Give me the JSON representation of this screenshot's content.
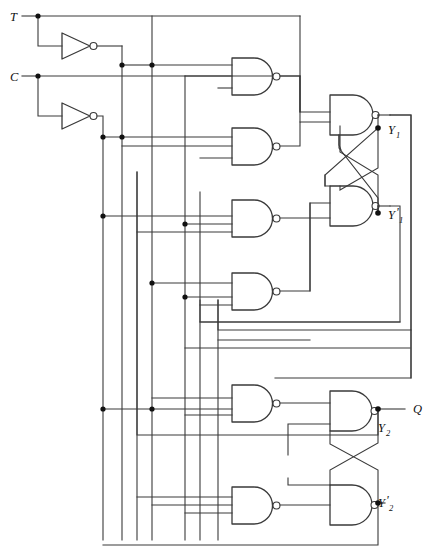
{
  "diagram": {
    "type": "logic-circuit-schematic",
    "width": 433,
    "height": 560,
    "background_color": "#ffffff",
    "wire_color": "#3a3a3a",
    "junction_color": "#111111"
  },
  "inputs": [
    {
      "id": "T",
      "label": "T",
      "x": 12,
      "y": 16
    },
    {
      "id": "C",
      "label": "C",
      "x": 12,
      "y": 76
    }
  ],
  "outputs": [
    {
      "id": "Q",
      "label": "Q",
      "x": 413,
      "y": 409
    }
  ],
  "state_labels": [
    {
      "id": "Y1",
      "base": "Y",
      "sub": "1",
      "prime": "",
      "text": "Y1",
      "x": 391,
      "y": 128
    },
    {
      "id": "Y1p",
      "base": "Y",
      "sub": "1",
      "prime": "'",
      "text": "Y'1",
      "x": 391,
      "y": 213
    },
    {
      "id": "Y2",
      "base": "Y",
      "sub": "2",
      "prime": "",
      "text": "Y2",
      "x": 381,
      "y": 428
    },
    {
      "id": "Y2p",
      "base": "Y",
      "sub": "2",
      "prime": "'",
      "text": "Y'2",
      "x": 381,
      "y": 503
    }
  ],
  "gates": [
    {
      "id": "INV1",
      "type": "inverter",
      "name": "inverter-t",
      "inputs": 1,
      "x": 62,
      "y": 33,
      "w": 30,
      "h": 26
    },
    {
      "id": "INV2",
      "type": "inverter",
      "name": "inverter-c",
      "inputs": 1,
      "x": 62,
      "y": 103,
      "w": 30,
      "h": 26
    },
    {
      "id": "N1",
      "type": "nand",
      "name": "nand-gate-1",
      "inputs": 3,
      "x": 232,
      "y": 58,
      "w": 43,
      "h": 37
    },
    {
      "id": "N2",
      "type": "nand",
      "name": "nand-gate-2",
      "inputs": 3,
      "x": 232,
      "y": 128,
      "w": 43,
      "h": 37
    },
    {
      "id": "N3",
      "type": "nand",
      "name": "nand-gate-3",
      "inputs": 3,
      "x": 232,
      "y": 200,
      "w": 43,
      "h": 37
    },
    {
      "id": "N4",
      "type": "nand",
      "name": "nand-gate-4",
      "inputs": 3,
      "x": 232,
      "y": 273,
      "w": 43,
      "h": 37
    },
    {
      "id": "N5",
      "type": "nand",
      "name": "nand-gate-5",
      "inputs": 3,
      "x": 330,
      "y": 95,
      "w": 45,
      "h": 40
    },
    {
      "id": "N6",
      "type": "nand",
      "name": "nand-gate-6",
      "inputs": 3,
      "x": 330,
      "y": 186,
      "w": 45,
      "h": 40
    },
    {
      "id": "N7",
      "type": "nand",
      "name": "nand-gate-7",
      "inputs": 3,
      "x": 232,
      "y": 385,
      "w": 43,
      "h": 37
    },
    {
      "id": "N8",
      "type": "nand",
      "name": "nand-gate-8",
      "inputs": 3,
      "x": 232,
      "y": 487,
      "w": 43,
      "h": 37
    },
    {
      "id": "N9",
      "type": "nand",
      "name": "nand-gate-9",
      "inputs": 3,
      "x": 330,
      "y": 391,
      "w": 45,
      "h": 40
    },
    {
      "id": "N10",
      "type": "nand",
      "name": "nand-gate-10",
      "inputs": 3,
      "x": 330,
      "y": 485,
      "w": 45,
      "h": 40
    }
  ],
  "junction_dots": [
    {
      "x": 38,
      "y": 16
    },
    {
      "x": 38,
      "y": 76
    },
    {
      "x": 152,
      "y": 65
    },
    {
      "x": 122,
      "y": 65
    },
    {
      "x": 122,
      "y": 137
    },
    {
      "x": 103,
      "y": 137
    },
    {
      "x": 103,
      "y": 216
    },
    {
      "x": 185,
      "y": 224
    },
    {
      "x": 152,
      "y": 283
    },
    {
      "x": 185,
      "y": 297
    },
    {
      "x": 103,
      "y": 409
    },
    {
      "x": 152,
      "y": 409
    },
    {
      "x": 378,
      "y": 128
    },
    {
      "x": 378,
      "y": 213
    },
    {
      "x": 378,
      "y": 409
    },
    {
      "x": 378,
      "y": 503
    }
  ],
  "buses": [
    {
      "id": "bus-t",
      "x": 152,
      "label": "T"
    },
    {
      "id": "bus-tbar",
      "x": 122,
      "label": "T'"
    },
    {
      "id": "bus-c",
      "x": 185,
      "label": "C"
    },
    {
      "id": "bus-cbar",
      "x": 103,
      "label": "C'"
    },
    {
      "id": "bus-fb-a",
      "x": 137,
      "label": "feedback-a"
    },
    {
      "id": "bus-fb-b",
      "x": 200,
      "label": "feedback-b"
    },
    {
      "id": "bus-fb-c",
      "x": 218,
      "label": "feedback-c"
    }
  ],
  "latches": [
    {
      "id": "master",
      "name": "master-latch",
      "gates": [
        "N5",
        "N6"
      ],
      "outputs": [
        "Y1",
        "Y1p"
      ]
    },
    {
      "id": "slave",
      "name": "slave-latch",
      "gates": [
        "N9",
        "N10"
      ],
      "outputs": [
        "Y2",
        "Y2p"
      ]
    }
  ]
}
